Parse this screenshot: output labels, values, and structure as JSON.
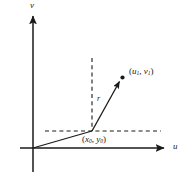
{
  "figure": {
    "background_color": "#ffffff",
    "stroke_color": "#1a1a1a"
  },
  "axes": {
    "vertical": {
      "label": "v",
      "label_x": 30,
      "label_y": 2,
      "x": 33,
      "y_top": 13,
      "y_bottom": 172,
      "arrow": "up"
    },
    "horizontal": {
      "label": "u",
      "label_x": 173,
      "label_y": 143,
      "y": 148,
      "x_left": 20,
      "x_right": 166,
      "arrow": "right"
    },
    "origin": {
      "x": 33,
      "y": 148
    }
  },
  "vector": {
    "label": "r",
    "label_x": 97,
    "label_y": 95,
    "from": {
      "x": 33,
      "y": 148
    },
    "corner": {
      "x": 92,
      "y": 131
    },
    "to": {
      "x": 122,
      "y": 78
    },
    "arrow": "to-end"
  },
  "points": [
    {
      "name": "point-uv",
      "label_prefix": "(",
      "var1": "u",
      "sub1": "1",
      "sep": ", ",
      "var2": "v",
      "sub2": "1",
      "label_suffix": ")",
      "dot_x": 122,
      "dot_y": 78,
      "label_x": 129,
      "label_y": 68
    },
    {
      "name": "point-xy",
      "label_prefix": "(",
      "var1": "x",
      "sub1": "0",
      "sep": ", ",
      "var2": "y",
      "sub2": "0",
      "label_suffix": ")",
      "dot_x": 92,
      "dot_y": 131,
      "label_x": 82,
      "label_y": 136
    }
  ],
  "dashed_lines": [
    {
      "name": "vertical-guide",
      "x1": 92,
      "y1": 58,
      "x2": 92,
      "y2": 131
    },
    {
      "name": "horizontal-guide",
      "x1": 45,
      "y1": 131,
      "x2": 161,
      "y2": 131
    }
  ]
}
